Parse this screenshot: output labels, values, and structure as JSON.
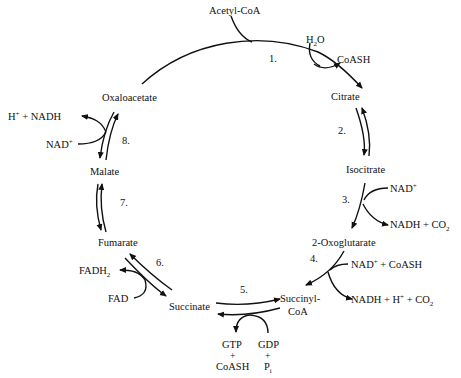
{
  "diagram": {
    "metabolites": {
      "acetyl_coa": "Acetyl-CoA",
      "citrate": "Citrate",
      "isocitrate": "Isocitrate",
      "oxoglutarate": "2-Oxoglutarate",
      "succinyl_coa_1": "Succinyl-",
      "succinyl_coa_2": "CoA",
      "succinate": "Succinate",
      "fumarate": "Fumarate",
      "malate": "Malate",
      "oxaloacetate": "Oxaloacetate"
    },
    "steps": [
      "1.",
      "2.",
      "3.",
      "4.",
      "5.",
      "6.",
      "7.",
      "8."
    ],
    "cofactors": {
      "step1_in": "H",
      "step1_in_sub": "2",
      "step1_in_tail": "O",
      "step1_out": "CoASH",
      "step3_in": "NAD",
      "step3_in_sup": "+",
      "step3_out": "NADH + CO",
      "step3_out_sub": "2",
      "step4_in": "NAD",
      "step4_in_sup": "+",
      "step4_in_tail": " + CoASH",
      "step4_out": "NADH + H",
      "step4_out_sup": "+",
      "step4_out_tail": " + CO",
      "step4_out_sub": "2",
      "step5_out_1": "GTP",
      "step5_out_plus": "+",
      "step5_out_2": "CoASH",
      "step5_in_1": "GDP",
      "step5_in_plus": "+",
      "step5_in_2": "P",
      "step5_in_2_sub": "i",
      "step6_in": "FAD",
      "step6_out": "FADH",
      "step6_out_sub": "2",
      "step8_in": "NAD",
      "step8_in_sup": "+",
      "step8_out": "H",
      "step8_out_sup": "+",
      "step8_out_tail": " +  NADH"
    }
  }
}
